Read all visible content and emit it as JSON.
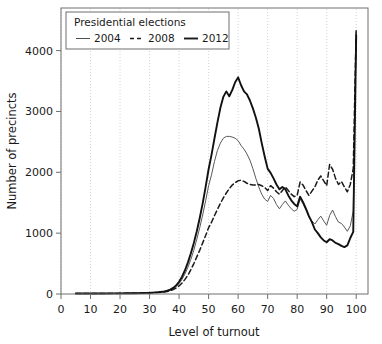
{
  "chart_data": {
    "type": "line",
    "title": "",
    "xlabel": "Level of turnout",
    "ylabel": "Number of precincts",
    "xlim": [
      0,
      104
    ],
    "ylim": [
      0,
      4700
    ],
    "xticks": [
      0,
      10,
      20,
      30,
      40,
      50,
      60,
      70,
      80,
      90,
      100
    ],
    "yticks": [
      0,
      1000,
      2000,
      3000,
      4000
    ],
    "grid": "vertical-dotted",
    "legend": {
      "title": "Presidential elections",
      "position": "top-left",
      "entries": [
        {
          "name": "2004",
          "style": "solid-thin",
          "color": "#4d4d4d"
        },
        {
          "name": "2008",
          "style": "dashed",
          "color": "#1a1a1a"
        },
        {
          "name": "2012",
          "style": "solid-thick",
          "color": "#1a1a1a"
        }
      ]
    },
    "x": [
      5,
      7,
      9,
      11,
      13,
      15,
      17,
      19,
      21,
      23,
      25,
      27,
      29,
      31,
      33,
      35,
      36,
      37,
      38,
      39,
      40,
      41,
      42,
      43,
      44,
      45,
      46,
      47,
      48,
      49,
      50,
      51,
      52,
      53,
      54,
      55,
      56,
      57,
      58,
      59,
      60,
      61,
      62,
      63,
      64,
      65,
      66,
      67,
      68,
      69,
      70,
      71,
      72,
      73,
      74,
      75,
      76,
      77,
      78,
      79,
      80,
      81,
      82,
      83,
      84,
      85,
      86,
      87,
      88,
      89,
      90,
      91,
      92,
      93,
      94,
      95,
      96,
      97,
      98,
      99,
      100
    ],
    "series": [
      {
        "name": "2004",
        "style": "solid-thin",
        "color": "#595959",
        "values": [
          8,
          8,
          8,
          8,
          9,
          9,
          10,
          10,
          11,
          12,
          13,
          15,
          18,
          22,
          28,
          38,
          48,
          62,
          85,
          120,
          170,
          240,
          330,
          440,
          570,
          720,
          900,
          1090,
          1300,
          1530,
          1780,
          1960,
          2180,
          2360,
          2480,
          2560,
          2590,
          2590,
          2580,
          2560,
          2520,
          2440,
          2380,
          2300,
          2200,
          2060,
          1900,
          1760,
          1640,
          1560,
          1520,
          1620,
          1570,
          1470,
          1400,
          1470,
          1530,
          1460,
          1400,
          1360,
          1390,
          1560,
          1480,
          1380,
          1260,
          1200,
          1150,
          1220,
          1280,
          1200,
          1130,
          1290,
          1380,
          1270,
          1180,
          1160,
          1100,
          1030,
          1120,
          1360,
          4300
        ]
      },
      {
        "name": "2008",
        "style": "dashed",
        "color": "#1a1a1a",
        "values": [
          8,
          8,
          8,
          8,
          9,
          9,
          10,
          10,
          11,
          12,
          13,
          15,
          17,
          20,
          25,
          33,
          42,
          54,
          72,
          98,
          132,
          180,
          240,
          310,
          400,
          500,
          610,
          720,
          840,
          960,
          1090,
          1180,
          1290,
          1390,
          1490,
          1580,
          1660,
          1730,
          1790,
          1830,
          1860,
          1870,
          1850,
          1820,
          1800,
          1790,
          1790,
          1800,
          1780,
          1750,
          1700,
          1780,
          1740,
          1680,
          1640,
          1700,
          1760,
          1700,
          1640,
          1600,
          1620,
          1840,
          1790,
          1700,
          1620,
          1690,
          1760,
          1870,
          1940,
          1860,
          1780,
          2130,
          2050,
          1900,
          1800,
          1850,
          1760,
          1680,
          1800,
          2060,
          4350
        ]
      },
      {
        "name": "2012",
        "style": "solid-thick",
        "color": "#111111",
        "values": [
          8,
          8,
          8,
          8,
          9,
          9,
          10,
          10,
          11,
          12,
          13,
          15,
          18,
          23,
          30,
          42,
          55,
          72,
          100,
          142,
          200,
          285,
          390,
          520,
          670,
          840,
          1030,
          1250,
          1490,
          1760,
          2050,
          2290,
          2560,
          2820,
          3060,
          3240,
          3330,
          3250,
          3350,
          3480,
          3560,
          3430,
          3330,
          3280,
          3180,
          3050,
          2900,
          2720,
          2480,
          2260,
          2060,
          1990,
          1900,
          1800,
          1720,
          1760,
          1720,
          1620,
          1540,
          1480,
          1440,
          1600,
          1510,
          1400,
          1280,
          1180,
          1060,
          1000,
          930,
          880,
          850,
          900,
          880,
          840,
          820,
          790,
          770,
          800,
          920,
          1020,
          4250
        ]
      }
    ]
  }
}
